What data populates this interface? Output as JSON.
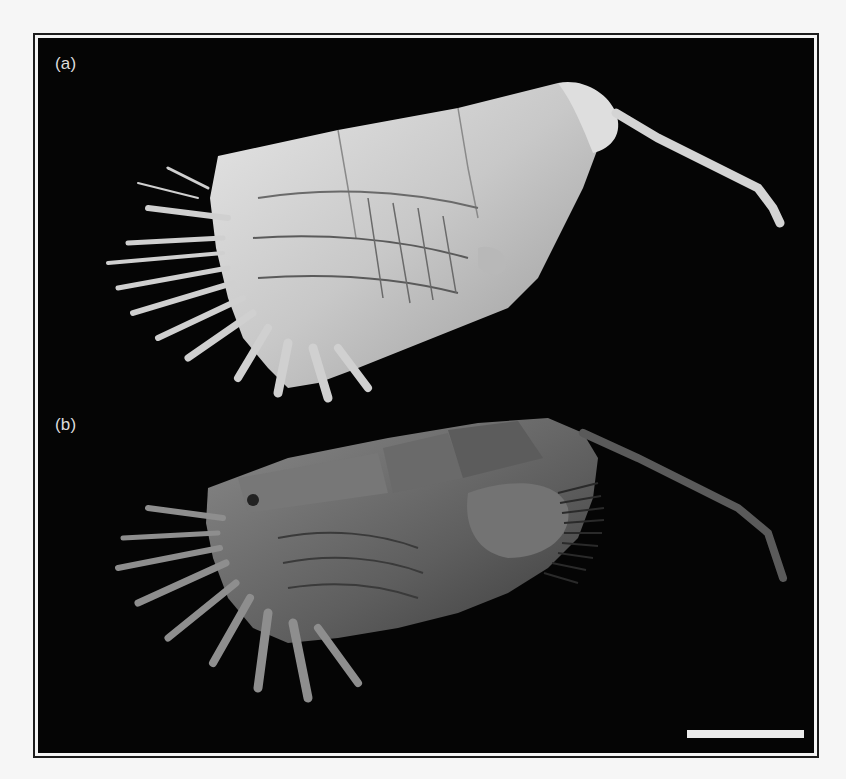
{
  "figure": {
    "panels": [
      {
        "id": "a",
        "label": "(a)",
        "render_style": "grayscale surface rendering",
        "specimen_tone": "#d8d8d8"
      },
      {
        "id": "b",
        "label": "(b)",
        "render_style": "segmented shaded rendering",
        "specimen_tone": "#6e6e6e"
      }
    ],
    "scale_bar": {
      "color": "#ececec",
      "label": ""
    },
    "background_color": "#050505",
    "border_color": "#1c1c1c"
  }
}
